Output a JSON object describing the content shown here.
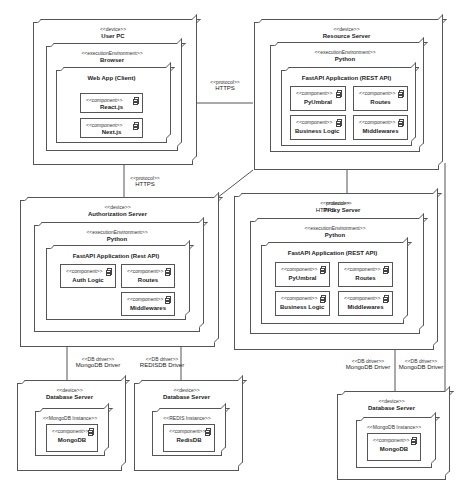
{
  "user_pc": {
    "stereotype": "<<device>>",
    "name": "User PC",
    "env": {
      "stereotype": "<<executionEnvironment>>",
      "name": "Browser"
    },
    "app": {
      "name": "Web App (Client)"
    },
    "components": [
      {
        "stereotype": "<<component>>",
        "name": "React.js"
      },
      {
        "stereotype": "<<component>>",
        "name": "Next.js"
      }
    ]
  },
  "resource_server": {
    "stereotype": "<<device>>",
    "name": "Resource Server",
    "env": {
      "stereotype": "<<executionEnvironment>>",
      "name": "Python"
    },
    "app": {
      "name": "FastAPI Application (REST API)"
    },
    "components": [
      {
        "stereotype": "<<component>>",
        "name": "PyUmbral"
      },
      {
        "stereotype": "<<component>>",
        "name": "Routes"
      },
      {
        "stereotype": "<<component>>",
        "name": "Business Logic"
      },
      {
        "stereotype": "<<component>>",
        "name": "Middlewares"
      }
    ]
  },
  "auth_server": {
    "stereotype": "<<device>>",
    "name": "Authorization Server",
    "env": {
      "stereotype": "<<executionEnvironment>>",
      "name": "Python"
    },
    "app": {
      "name": "FastAPI Application (Rest API)"
    },
    "components": [
      {
        "stereotype": "<<component>>",
        "name": "Auth Logic"
      },
      {
        "stereotype": "<<component>>",
        "name": "Routes"
      },
      {
        "stereotype": "<<component>>",
        "name": "Middlewares"
      }
    ]
  },
  "proxy_server": {
    "stereotype": "<<device>>",
    "name": "Proxy Server",
    "overlap_stereotype": "<<protocol>>",
    "overlap_name": "HTTPS",
    "env": {
      "stereotype": "<<executionEnvironment>>",
      "name": "Python"
    },
    "app": {
      "name": "FastAPI Application (REST API)"
    },
    "components": [
      {
        "stereotype": "<<component>>",
        "name": "PyUmbral"
      },
      {
        "stereotype": "<<component>>",
        "name": "Routes"
      },
      {
        "stereotype": "<<component>>",
        "name": "Business Logic"
      },
      {
        "stereotype": "<<component>>",
        "name": "Middlewares"
      }
    ]
  },
  "db_mongo_1": {
    "stereotype": "<<device>>",
    "name": "Database Server",
    "instance": "<<MongoDB Instance>>",
    "component": {
      "stereotype": "<<component>>",
      "name": "MongoDB"
    }
  },
  "db_redis": {
    "stereotype": "<<device>>",
    "name": "Database Server",
    "instance": "<<REDIS Instance>>",
    "component": {
      "stereotype": "<<component>>",
      "name": "RedisDB"
    }
  },
  "db_mongo_2": {
    "stereotype": "<<device>>",
    "name": "Database Server",
    "instance": "<<MongoDB Instance>>",
    "component": {
      "stereotype": "<<component>>",
      "name": "MongoDB"
    }
  },
  "connections": {
    "pc_resource": {
      "stereotype": "<<protocol>>",
      "name": "HTTPS"
    },
    "pc_auth": {
      "stereotype": "<<protocol>>",
      "name": "HTTPS"
    },
    "auth_mongo": {
      "stereotype": "<<DB driver>>",
      "name": "MongoDB Driver"
    },
    "auth_redis": {
      "stereotype": "<<DB driver>>",
      "name": "REDISDB Driver"
    },
    "proxy_mongo": {
      "stereotype": "<<DB driver>>",
      "name": "MongoDB Driver"
    },
    "resource_mongo": {
      "stereotype": "<<DB driver>>",
      "name": "MongoDB Driver"
    }
  }
}
